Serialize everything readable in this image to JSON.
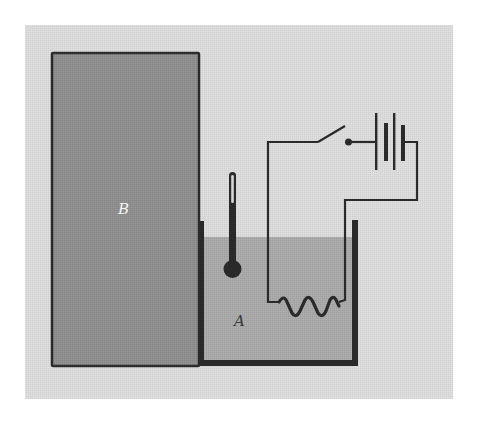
{
  "figure": {
    "labels": {
      "block": "B",
      "container": "A"
    },
    "components": [
      {
        "id": "block-b",
        "name": "Block B"
      },
      {
        "id": "container-a",
        "name": "Container A with liquid"
      },
      {
        "id": "thermometer",
        "name": "Thermometer"
      },
      {
        "id": "heater-resistor",
        "name": "Resistive heating coil"
      },
      {
        "id": "switch",
        "name": "Switch (open)"
      },
      {
        "id": "battery",
        "name": "Battery"
      }
    ],
    "colors": {
      "page_background": "#ffffff",
      "panel_background": "#dcdcdc",
      "block_fill": "#8e8e8e",
      "liquid_fill": "#a9a9a9",
      "line": "#2a2a2a",
      "label_on_dark": "#f2f2f2",
      "label_on_liquid": "#3a3a3a"
    }
  }
}
